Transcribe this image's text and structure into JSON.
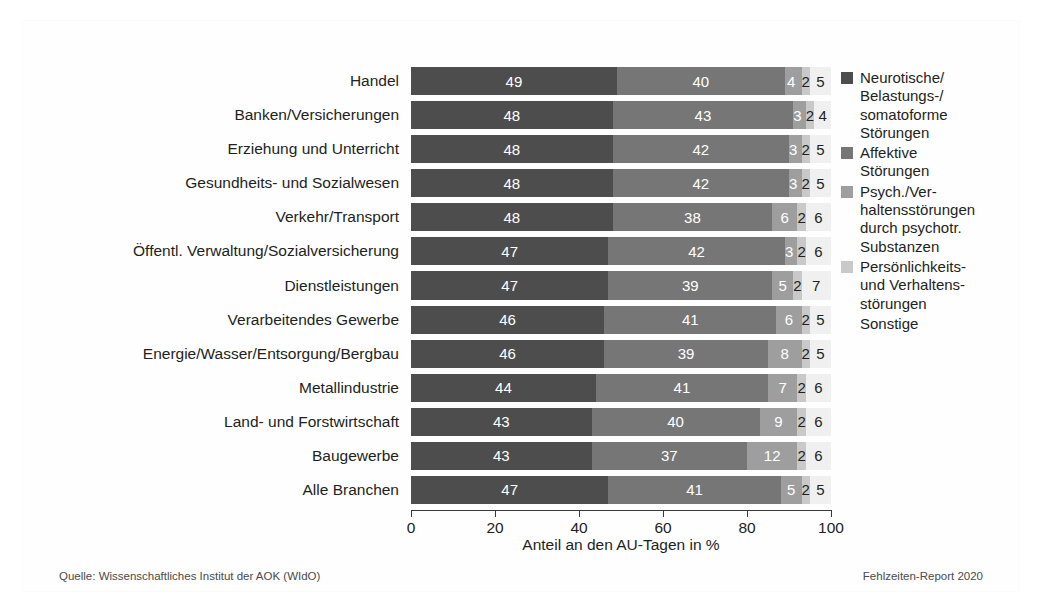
{
  "figure": {
    "source_note": "Quelle: Wissenschaftliches Institut der AOK (WIdO)",
    "report_note": "Fehlzeiten-Report 2020"
  },
  "colors": {
    "series": [
      "#4d4d4d",
      "#767676",
      "#9e9e9e",
      "#c9c9c9",
      "#f0f0f0"
    ],
    "label_light": "#ffffff",
    "label_dark": "#231f20",
    "axis": "#3a3a3a",
    "text": "#231f20"
  },
  "chart_data": {
    "type": "bar",
    "orientation": "horizontal",
    "stacked": true,
    "normalized_percent": true,
    "title": "",
    "xlabel": "Anteil an den AU-Tagen in %",
    "ylabel": "",
    "xlim": [
      0,
      100
    ],
    "xticks": [
      0,
      20,
      40,
      60,
      80,
      100
    ],
    "xtick_labels": [
      "0",
      "20",
      "40",
      "60",
      "80",
      "100"
    ],
    "grid": false,
    "legend_position": "right",
    "categories": [
      "Handel",
      "Banken/Versicherungen",
      "Erziehung und Unterricht",
      "Gesundheits- und Sozialwesen",
      "Verkehr/Transport",
      "Öffentl. Verwaltung/Sozialversicherung",
      "Dienstleistungen",
      "Verarbeitendes Gewerbe",
      "Energie/Wasser/Entsorgung/Bergbau",
      "Metallindustrie",
      "Land- und Forstwirtschaft",
      "Baugewerbe",
      "Alle Branchen"
    ],
    "series": [
      {
        "name": "Neurotische/ Belastungs-/ somatoforme Störungen",
        "legend_label": "Neurotische/\nBelastungs-/\nsomatoforme\nStörungen",
        "color": "#4d4d4d",
        "values": [
          49,
          48,
          48,
          48,
          48,
          47,
          47,
          46,
          46,
          44,
          43,
          43,
          47
        ]
      },
      {
        "name": "Affektive Störungen",
        "legend_label": "Affektive\nStörungen",
        "color": "#767676",
        "values": [
          40,
          43,
          42,
          42,
          38,
          42,
          39,
          41,
          39,
          41,
          40,
          37,
          41
        ]
      },
      {
        "name": "Psych./Verhaltensstörungen durch psychotr. Substanzen",
        "legend_label": "Psych./Ver-\nhaltensstörungen\ndurch psychotr.\nSubstanzen",
        "color": "#9e9e9e",
        "values": [
          4,
          3,
          3,
          3,
          6,
          3,
          5,
          6,
          8,
          7,
          9,
          12,
          5
        ]
      },
      {
        "name": "Persönlichkeits- und Verhaltensstörungen",
        "legend_label": "Persönlichkeits-\nund Verhaltens-\nstörungen",
        "color": "#c9c9c9",
        "values": [
          2,
          2,
          2,
          2,
          2,
          2,
          2,
          2,
          2,
          2,
          2,
          2,
          2
        ]
      },
      {
        "name": "Sonstige",
        "legend_label": "Sonstige",
        "color": "#f0f0f0",
        "values": [
          5,
          4,
          5,
          5,
          6,
          6,
          7,
          5,
          5,
          6,
          6,
          6,
          5
        ]
      }
    ]
  }
}
